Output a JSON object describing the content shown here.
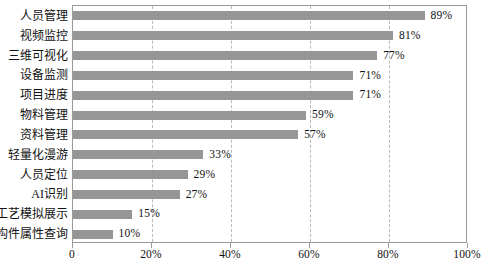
{
  "chart_data": {
    "type": "bar",
    "orientation": "horizontal",
    "title": "",
    "subtitle": "",
    "xlabel": "",
    "ylabel": "",
    "xlim": [
      0,
      100
    ],
    "grid": "vertical-dashed",
    "legend": "none",
    "value_suffix": "%",
    "categories": [
      "人员管理",
      "视频监控",
      "三维可视化",
      "设备监测",
      "项目进度",
      "物料管理",
      "资料管理",
      "轻量化漫游",
      "人员定位",
      "AI识别",
      "工艺模拟展示",
      "构件属性查询"
    ],
    "values": [
      89,
      81,
      77,
      71,
      71,
      59,
      57,
      33,
      29,
      27,
      15,
      10
    ],
    "data_labels": [
      "89%",
      "81%",
      "77%",
      "71%",
      "71%",
      "59%",
      "57%",
      "33%",
      "29%",
      "27%",
      "15%",
      "10%"
    ],
    "xticks": [
      0,
      20,
      40,
      60,
      80,
      100
    ],
    "xtick_labels": [
      "0",
      "20%",
      "40%",
      "60%",
      "80%",
      "100%"
    ],
    "colors": {
      "bar": "#969696",
      "grid": "#b9b9b9",
      "frame": "#9a9a9a",
      "text": "#111111",
      "background": "#ffffff"
    }
  }
}
